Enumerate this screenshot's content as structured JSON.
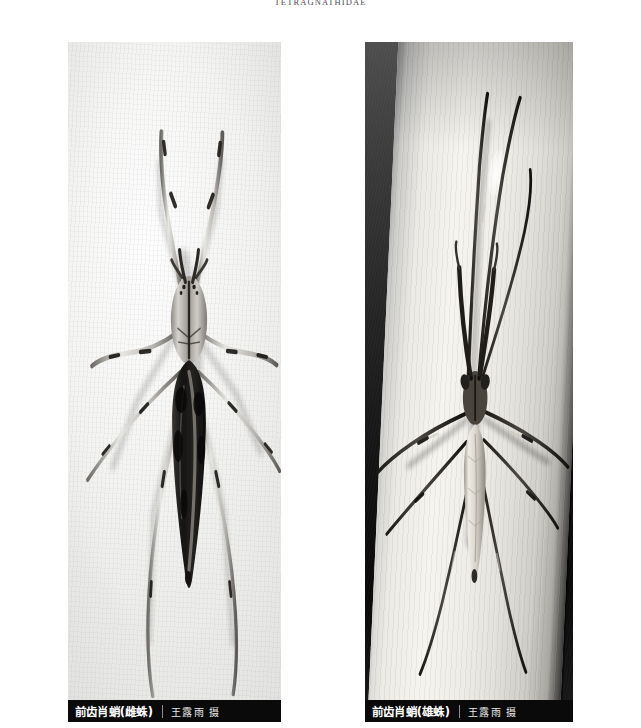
{
  "page": {
    "running_head": "TETRAGNATHIDAE",
    "background_color": "#ffffff"
  },
  "plate": {
    "figures": [
      {
        "id": "female",
        "subject": "Tetragnatha praedonia female spider on white paper",
        "photo_background": "white-paper",
        "caption": {
          "title": "前齿肖蛸(雌蛛)",
          "credit": "王露雨 摄",
          "bar_color": "#0a0a0a",
          "title_color": "#ffffff",
          "credit_color": "#e9e9e9"
        }
      },
      {
        "id": "male",
        "subject": "Tetragnatha praedonia male spider on a grass blade",
        "photo_background": "dark-with-leaf-blade",
        "caption": {
          "title": "前齿肖蛸(雄蛛)",
          "credit": "王露雨 摄",
          "bar_color": "#0a0a0a",
          "title_color": "#ffffff",
          "credit_color": "#e9e9e9"
        }
      }
    ]
  },
  "icons": {
    "caption_separator": "vertical-rule"
  }
}
